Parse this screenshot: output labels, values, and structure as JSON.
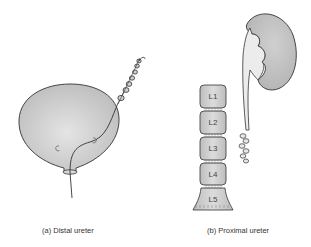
{
  "figure": {
    "panels": [
      {
        "id": "a",
        "caption": "(a) Distal ureter",
        "elements": [
          "bladder",
          "coiled-ureteral-stent",
          "catheter"
        ]
      },
      {
        "id": "b",
        "caption": "(b) Proximal ureter",
        "elements": [
          "kidney",
          "ureter",
          "lumbar-spine"
        ],
        "vertebrae": [
          "L1",
          "L2",
          "L3",
          "L4",
          "L5"
        ]
      }
    ],
    "colors": {
      "organ_fill": "#c8c8c8",
      "organ_highlight": "#e6e6e6",
      "outline": "#333333",
      "ureter_fill": "#ececec"
    }
  }
}
